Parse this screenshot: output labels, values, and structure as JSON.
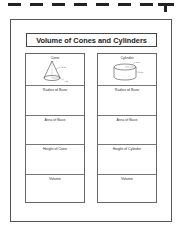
{
  "worksheet": {
    "title": "Volume of Cones and Cylinders",
    "columns": [
      {
        "shape": "Cone",
        "shape_icon": "cone-diagram",
        "dimension_labels": [
          "3 m",
          "4 m"
        ],
        "rows": [
          "Radius of Base",
          "Area of Base",
          "Height of Cone",
          "Volume"
        ]
      },
      {
        "shape": "Cylinder",
        "shape_icon": "cylinder-diagram",
        "dimension_labels": [
          "3 m",
          "5 m"
        ],
        "rows": [
          "Radius of Base",
          "Area of Base",
          "Height of Cylinder",
          "Volume"
        ]
      }
    ]
  }
}
